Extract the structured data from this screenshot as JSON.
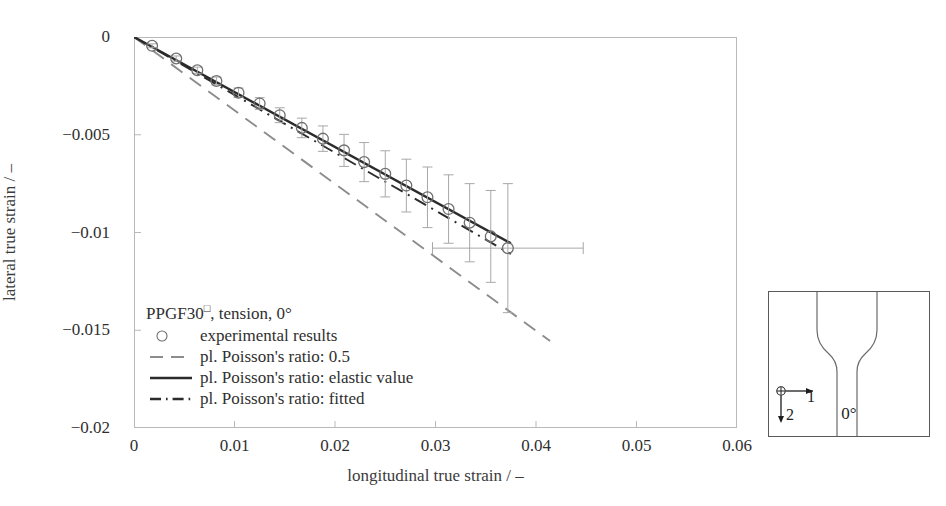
{
  "chart_data": {
    "type": "scatter",
    "title": "",
    "xlabel": "longitudinal true strain / –",
    "ylabel": "lateral true strain / –",
    "xlim": [
      0,
      0.06
    ],
    "ylim": [
      -0.02,
      0
    ],
    "xticks": [
      "0",
      "0.01",
      "0.02",
      "0.03",
      "0.04",
      "0.05",
      "0.06"
    ],
    "xtick_values": [
      0,
      0.01,
      0.02,
      0.03,
      0.04,
      0.05,
      0.06
    ],
    "yticks": [
      "0",
      "−0.005",
      "−0.01",
      "−0.015",
      "−0.02"
    ],
    "ytick_values": [
      0,
      -0.005,
      -0.01,
      -0.015,
      -0.02
    ],
    "grid": false,
    "legend_position": "lower-left-inside",
    "series": [
      {
        "name": "experimental results",
        "type": "scatter",
        "marker": "open-circle",
        "color": "#6e6e6e",
        "x": [
          0.0018,
          0.0042,
          0.0063,
          0.0082,
          0.0104,
          0.0125,
          0.0145,
          0.0167,
          0.0188,
          0.0209,
          0.0229,
          0.025,
          0.0271,
          0.0292,
          0.0313,
          0.0334,
          0.0355,
          0.0372
        ],
        "y": [
          -0.00045,
          -0.0011,
          -0.0017,
          -0.00225,
          -0.00285,
          -0.0034,
          -0.004,
          -0.00465,
          -0.0052,
          -0.0058,
          -0.0064,
          -0.007,
          -0.0076,
          -0.0082,
          -0.0088,
          -0.0095,
          -0.0102,
          -0.0108
        ],
        "yerr": [
          0.0001,
          0.00013,
          0.00016,
          0.0002,
          0.00024,
          0.0003,
          0.00038,
          0.0005,
          0.00065,
          0.00082,
          0.001,
          0.00118,
          0.00135,
          0.00155,
          0.00175,
          0.002,
          0.00235,
          0.0033
        ],
        "xerr_last": 0.0075
      },
      {
        "name": "pl. Poisson's ratio: 0.5",
        "type": "line",
        "style": "dashed",
        "color": "#8c8c8c",
        "x": [
          0.0,
          0.0414
        ],
        "y": [
          0.0,
          -0.01555
        ]
      },
      {
        "name": "pl. Poisson's ratio: elastic value",
        "type": "line",
        "style": "solid",
        "color": "#2b2b2b",
        "x": [
          0.0,
          0.0375
        ],
        "y": [
          0.0,
          -0.01055
        ]
      },
      {
        "name": "pl. Poisson's ratio: fitted",
        "type": "line",
        "style": "dash-dot",
        "color": "#2b2b2b",
        "x": [
          0.0,
          0.0375
        ],
        "y": [
          0.0,
          -0.0111
        ]
      }
    ]
  },
  "legend": {
    "title_prefix": "PPGF30",
    "title_superscript": "□",
    "title_suffix": ", tension, 0°",
    "entries": [
      {
        "label": "experimental results",
        "key": "open-circle-marker"
      },
      {
        "label": "pl. Poisson's ratio: 0.5",
        "key": "dashed-line"
      },
      {
        "label": "pl. Poisson's ratio: elastic value",
        "key": "solid-line"
      },
      {
        "label": "pl. Poisson's ratio: fitted",
        "key": "dash-dot-line"
      }
    ]
  },
  "specimen": {
    "angle_label": "0°",
    "axis_1_label": "1",
    "axis_2_label": "2"
  },
  "colors": {
    "frame": "#b9b9b9",
    "marker": "#6e6e6e",
    "errorbar": "#a8a8a8",
    "dashed_line": "#8c8c8c",
    "solid_line": "#2b2b2b",
    "dashdot_line": "#2b2b2b",
    "text": "#303030",
    "specimen_outline": "#5a5a5a"
  }
}
